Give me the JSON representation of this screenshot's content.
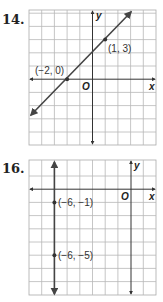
{
  "problems": [
    {
      "number": "14.",
      "graph": {
        "x_range": [
          -5,
          5
        ],
        "y_range": [
          -5,
          6
        ],
        "axis_labels": {
          "x": "x",
          "y": "y",
          "origin": "O"
        },
        "line": {
          "type": "line",
          "slope": 1,
          "y_intercept": 2,
          "equation_form": "through (-2, 0) and (1, 3)"
        },
        "points": [
          {
            "label": "(−2, 0)",
            "x": -2,
            "y": 0
          },
          {
            "label": "(1, 3)",
            "x": 1,
            "y": 3
          }
        ]
      }
    },
    {
      "number": "16.",
      "graph": {
        "x_range": [
          -9,
          1
        ],
        "y_range": [
          -8,
          2
        ],
        "axis_labels": {
          "x": "x",
          "y": "y",
          "origin": "O"
        },
        "line": {
          "type": "vertical",
          "x": -6
        },
        "points": [
          {
            "label": "(−6, −1)",
            "x": -6,
            "y": -1
          },
          {
            "label": "(−6, −5)",
            "x": -6,
            "y": -5
          }
        ]
      }
    }
  ],
  "colors": {
    "grid": "#b8b8b8",
    "axis": "#333333",
    "line": "#444444",
    "point": "#333333"
  }
}
